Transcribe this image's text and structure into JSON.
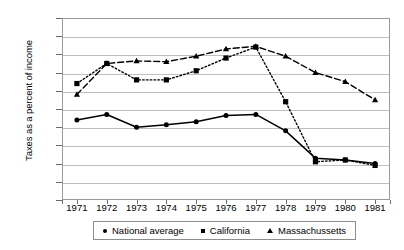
{
  "chart_data": {
    "type": "line",
    "title": "",
    "xlabel": "",
    "ylabel": "Taxes as a percent of income",
    "categories": [
      "1971",
      "1972",
      "1973",
      "1974",
      "1975",
      "1976",
      "1977",
      "1978",
      "1979",
      "1980",
      "1981"
    ],
    "ylim": [
      8,
      13
    ],
    "ytick_values": [
      8,
      8.5,
      9,
      9.5,
      10,
      10.5,
      11,
      11.5,
      12,
      12.5,
      13
    ],
    "ytick_labels": [
      "8%",
      "9%",
      "9%",
      "10%",
      "10%",
      "11%",
      "11%",
      "12%",
      "12%",
      "13%"
    ],
    "ytick_labels_top_down": [
      "13%",
      "12%",
      "12%",
      "11%",
      "11%",
      "10%",
      "10%",
      "9%",
      "9%",
      "8%"
    ],
    "grid": true,
    "legend_position": "bottom",
    "series": [
      {
        "name": "National average",
        "marker": "circle",
        "linestyle": "solid",
        "color": "#000000",
        "values": [
          10.2,
          10.35,
          10.0,
          10.07,
          10.15,
          10.32,
          10.35,
          9.9,
          9.15,
          9.1,
          9.0
        ]
      },
      {
        "name": "California",
        "marker": "square",
        "linestyle": "dotted",
        "color": "#000000",
        "values": [
          11.2,
          11.75,
          11.3,
          11.3,
          11.55,
          11.9,
          12.2,
          10.7,
          9.05,
          9.1,
          8.95
        ]
      },
      {
        "name": "Massachussetts",
        "marker": "triangle",
        "linestyle": "dashed",
        "color": "#000000",
        "values": [
          10.9,
          11.75,
          11.82,
          11.8,
          11.95,
          12.15,
          12.22,
          11.95,
          11.5,
          11.25,
          10.75
        ]
      }
    ]
  },
  "legend": {
    "items": [
      {
        "label": "National average",
        "marker": "circle-marker"
      },
      {
        "label": "California",
        "marker": "square-marker"
      },
      {
        "label": "Massachussetts",
        "marker": "triangle-marker"
      }
    ]
  }
}
